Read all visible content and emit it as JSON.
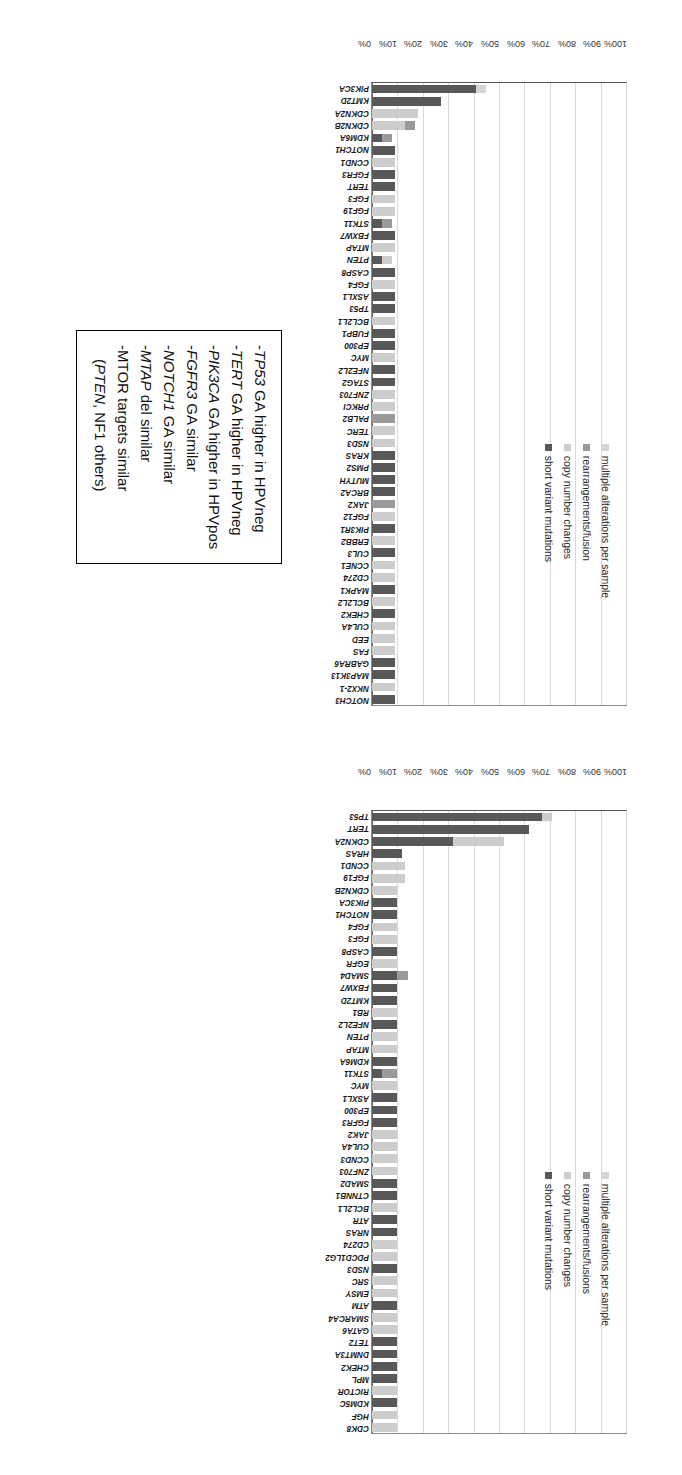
{
  "charts": [
    {
      "id": "hpv-positive",
      "title": "HPV Positive Clinically Advanced Penile SCC",
      "ylabel": "",
      "yticks": [
        "0%",
        "10%",
        "20%",
        "30%",
        "40%",
        "50%",
        "60%",
        "70%",
        "80%",
        "90%",
        "100%"
      ],
      "legend": [
        {
          "label": "multiple alterations per sample",
          "color": "#d6d6d6"
        },
        {
          "label": "rearrangements/fusion",
          "color": "#9a9a9a"
        },
        {
          "label": "copy number changes",
          "color": "#cdcdcd"
        },
        {
          "label": "short variant mutations",
          "color": "#585858"
        }
      ]
    },
    {
      "id": "hpv-negative",
      "title": "HPV Negative Clinically Advanced Penile SCC",
      "ylabel": "",
      "yticks": [
        "0%",
        "10%",
        "20%",
        "30%",
        "40%",
        "50%",
        "60%",
        "70%",
        "80%",
        "90%",
        "100%"
      ],
      "legend": [
        {
          "label": "multiple alterations per sample",
          "color": "#d6d6d6"
        },
        {
          "label": "rearrangements/fusions",
          "color": "#9a9a9a"
        },
        {
          "label": "copy number changes",
          "color": "#cdcdcd"
        },
        {
          "label": "short variant mutations",
          "color": "#585858"
        }
      ]
    }
  ],
  "callout": {
    "lines": [
      "-TP53 GA higher in HPVneg",
      "-TERT GA higher in HPVneg",
      "-PIK3CA GA higher in HPVpos",
      "-FGFR3 GA similar",
      "-NOTCH1 GA similar",
      "-MTAP del similar",
      "-MTOR targets similar",
      "(PTEN, NF1 others)"
    ]
  },
  "chart_data": [
    {
      "type": "bar",
      "id": "hpv-positive",
      "title": "HPV Positive Clinically Advanced Penile SCC",
      "xlabel": "",
      "ylabel": "",
      "ylim": [
        0,
        100
      ],
      "ytick_values": [
        0,
        10,
        20,
        30,
        40,
        50,
        60,
        70,
        80,
        90,
        100
      ],
      "grid": true,
      "stacked": true,
      "legend_position": "inside-top-right",
      "series_names": [
        "short variant mutations",
        "copy number changes",
        "rearrangements/fusion",
        "multiple alterations per sample"
      ],
      "series_colors": [
        "#585858",
        "#cdcdcd",
        "#9a9a9a",
        "#d6d6d6"
      ],
      "categories": [
        "PIK3CA",
        "KMT2D",
        "CDKN2A",
        "CDKN2B",
        "KDM6A",
        "NOTCH1",
        "CCND1",
        "FGFR3",
        "TERT",
        "FGF3",
        "FGF19",
        "STK11",
        "FBXW7",
        "MTAP",
        "PTEN",
        "CASP8",
        "FGF4",
        "ASXL1",
        "TP53",
        "BCL2L1",
        "FUBP1",
        "EP300",
        "MYC",
        "NFE2L2",
        "STAG2",
        "ZNF703",
        "PRKCI",
        "PALB2",
        "TERC",
        "NSD3",
        "KRAS",
        "PMS2",
        "MUTYH",
        "BRCA2",
        "JAK2",
        "FGF12",
        "PIK3R1",
        "ERBB2",
        "CUL3",
        "CCNE1",
        "CD274",
        "MAPK1",
        "BCL2L2",
        "CHEK2",
        "CUL4A",
        "EED",
        "FAS",
        "GABRA6",
        "MAP3K13",
        "NKX2-1",
        "NOTCH3"
      ],
      "series": [
        {
          "name": "short variant mutations",
          "values": [
            41,
            27,
            0,
            0,
            4,
            9,
            0,
            9,
            9,
            0,
            0,
            4,
            9,
            0,
            4,
            9,
            0,
            9,
            9,
            0,
            9,
            9,
            0,
            9,
            9,
            0,
            0,
            0,
            0,
            0,
            9,
            9,
            9,
            9,
            0,
            0,
            9,
            0,
            9,
            0,
            0,
            9,
            0,
            9,
            0,
            0,
            0,
            9,
            9,
            0,
            9
          ]
        },
        {
          "name": "copy number changes",
          "values": [
            0,
            0,
            18,
            13,
            0,
            0,
            9,
            0,
            0,
            9,
            9,
            0,
            0,
            9,
            4,
            0,
            9,
            0,
            0,
            9,
            0,
            0,
            9,
            0,
            0,
            9,
            9,
            0,
            9,
            9,
            0,
            0,
            0,
            0,
            0,
            9,
            0,
            9,
            0,
            9,
            9,
            0,
            9,
            0,
            9,
            9,
            9,
            0,
            0,
            9,
            0
          ]
        },
        {
          "name": "rearrangements/fusion",
          "values": [
            0,
            0,
            0,
            4,
            4,
            0,
            0,
            0,
            0,
            0,
            0,
            4,
            0,
            0,
            0,
            0,
            0,
            0,
            0,
            0,
            0,
            0,
            0,
            0,
            0,
            0,
            0,
            9,
            0,
            0,
            0,
            0,
            0,
            0,
            9,
            0,
            0,
            0,
            0,
            0,
            0,
            0,
            0,
            0,
            0,
            0,
            0,
            0,
            0,
            0,
            0
          ]
        },
        {
          "name": "multiple alterations per sample",
          "values": [
            4,
            0,
            0,
            0,
            0,
            0,
            0,
            0,
            0,
            0,
            0,
            0,
            0,
            0,
            0,
            0,
            0,
            0,
            0,
            0,
            0,
            0,
            0,
            0,
            0,
            0,
            0,
            0,
            0,
            0,
            0,
            0,
            0,
            0,
            0,
            0,
            0,
            0,
            0,
            0,
            0,
            0,
            0,
            0,
            0,
            0,
            0,
            0,
            0,
            0,
            0
          ]
        }
      ]
    },
    {
      "type": "bar",
      "id": "hpv-negative",
      "title": "HPV Negative Clinically Advanced Penile SCC",
      "xlabel": "",
      "ylabel": "",
      "ylim": [
        0,
        100
      ],
      "ytick_values": [
        0,
        10,
        20,
        30,
        40,
        50,
        60,
        70,
        80,
        90,
        100
      ],
      "grid": true,
      "stacked": true,
      "legend_position": "inside-top-right",
      "series_names": [
        "short variant mutations",
        "copy number changes",
        "rearrangements/fusions",
        "multiple alterations per sample"
      ],
      "series_colors": [
        "#585858",
        "#cdcdcd",
        "#9a9a9a",
        "#d6d6d6"
      ],
      "categories": [
        "TP53",
        "TERT",
        "CDKN2A",
        "HRAS",
        "CCND1",
        "FGF19",
        "CDKN2B",
        "PIK3CA",
        "NOTCH1",
        "FGF4",
        "FGF3",
        "CASP8",
        "EGFR",
        "SMAD4",
        "FBXW7",
        "KMT2D",
        "RB1",
        "NFE2L2",
        "PTEN",
        "MTAP",
        "KDM6A",
        "STK11",
        "MYC",
        "ASXL1",
        "EP300",
        "FGFR3",
        "JAK2",
        "CUL4A",
        "CCND3",
        "ZNF703",
        "SMAD2",
        "CTNNB1",
        "BCL2L1",
        "ATR",
        "NRAS",
        "CD274",
        "PDCD1LG2",
        "NSD3",
        "SRC",
        "EMSY",
        "ATM",
        "SMARCA4",
        "GATA6",
        "TET2",
        "DNMT3A",
        "CHEK2",
        "MPL",
        "RICTOR",
        "KDM5C",
        "HGF",
        "CDK8"
      ],
      "series": [
        {
          "name": "short variant mutations",
          "values": [
            67,
            62,
            32,
            12,
            0,
            0,
            0,
            10,
            10,
            0,
            0,
            10,
            0,
            10,
            10,
            10,
            0,
            10,
            0,
            0,
            10,
            4,
            0,
            10,
            10,
            10,
            0,
            0,
            0,
            0,
            10,
            10,
            0,
            10,
            10,
            0,
            0,
            10,
            0,
            0,
            10,
            0,
            0,
            10,
            10,
            10,
            10,
            0,
            10,
            0,
            0
          ]
        },
        {
          "name": "copy number changes",
          "values": [
            4,
            0,
            20,
            0,
            13,
            13,
            10,
            0,
            0,
            10,
            10,
            0,
            10,
            0,
            0,
            0,
            10,
            0,
            10,
            10,
            0,
            0,
            10,
            0,
            0,
            0,
            10,
            10,
            10,
            10,
            0,
            0,
            10,
            0,
            0,
            10,
            10,
            0,
            10,
            10,
            0,
            10,
            10,
            0,
            0,
            0,
            0,
            10,
            0,
            10,
            10
          ]
        },
        {
          "name": "rearrangements/fusions",
          "values": [
            0,
            0,
            0,
            0,
            0,
            0,
            0,
            0,
            0,
            0,
            0,
            0,
            0,
            4,
            0,
            0,
            0,
            0,
            0,
            0,
            0,
            6,
            0,
            0,
            0,
            0,
            0,
            0,
            0,
            0,
            0,
            0,
            0,
            0,
            0,
            0,
            0,
            0,
            0,
            0,
            0,
            0,
            0,
            0,
            0,
            0,
            0,
            0,
            0,
            0,
            0
          ]
        },
        {
          "name": "multiple alterations per sample",
          "values": [
            0,
            0,
            0,
            0,
            0,
            0,
            0,
            0,
            0,
            0,
            0,
            0,
            0,
            0,
            0,
            0,
            0,
            0,
            0,
            0,
            0,
            0,
            0,
            0,
            0,
            0,
            0,
            0,
            0,
            0,
            0,
            0,
            0,
            0,
            0,
            0,
            0,
            0,
            0,
            0,
            0,
            0,
            0,
            0,
            0,
            0,
            0,
            0,
            0,
            0,
            0
          ]
        }
      ]
    }
  ]
}
